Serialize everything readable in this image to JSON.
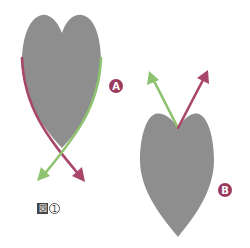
{
  "figure": {
    "caption_prefix": "図",
    "caption_number": "1",
    "colors": {
      "shape_fill": "#8e8e8e",
      "arrow_green": "#8dc26f",
      "arrow_magenta": "#a8466b",
      "badge": "#9b3a5e",
      "badge_text": "#ffffff"
    },
    "shapes": [
      {
        "id": "A",
        "description": "heart shape (two lobes on top, point down) with crossing arrows below",
        "badge_label": "A"
      },
      {
        "id": "B",
        "description": "inverted teardrop shape (notch on top, point down) with diverging arrows above",
        "badge_label": "B"
      }
    ]
  }
}
